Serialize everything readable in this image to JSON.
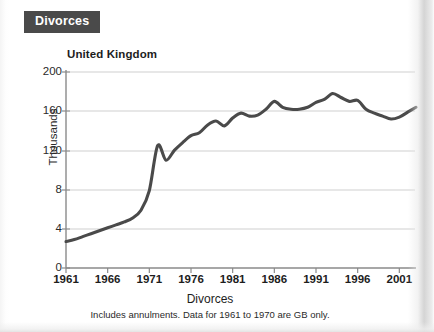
{
  "header": {
    "badge_label": "Divorces",
    "badge_bg": "#4a4a4a",
    "badge_fg": "#ffffff"
  },
  "chart_data": {
    "type": "line",
    "title": "United Kingdom",
    "section_title": "Divorces",
    "xlabel": "Divorces",
    "ylabel": "Thousands",
    "footnote": "Includes annulments. Data for 1961 to 1970 are GB only.",
    "line_color": "#4a4a4a",
    "grid": true,
    "legend": "none",
    "xlim": [
      1961,
      2003
    ],
    "ylim": [
      0,
      200
    ],
    "ytick_labels": [
      "200",
      "160",
      "120",
      "8",
      "4",
      "0"
    ],
    "ytick_values": [
      200,
      160,
      120,
      80,
      40,
      0
    ],
    "xtick_labels": [
      "1961",
      "1966",
      "1971",
      "1976",
      "1981",
      "1986",
      "1991",
      "1996",
      "2001"
    ],
    "xtick_values": [
      1961,
      1966,
      1971,
      1976,
      1981,
      1986,
      1991,
      1996,
      2001
    ],
    "x": [
      1961,
      1962,
      1963,
      1964,
      1965,
      1966,
      1967,
      1968,
      1969,
      1970,
      1971,
      1972,
      1973,
      1974,
      1975,
      1976,
      1977,
      1978,
      1979,
      1980,
      1981,
      1982,
      1983,
      1984,
      1985,
      1986,
      1987,
      1988,
      1989,
      1990,
      1991,
      1992,
      1993,
      1994,
      1995,
      1996,
      1997,
      1998,
      1999,
      2000,
      2001,
      2002,
      2003
    ],
    "values": [
      27,
      29,
      32,
      35,
      38,
      41,
      44,
      47,
      51,
      59,
      79,
      125,
      110,
      120,
      128,
      135,
      138,
      146,
      150,
      145,
      153,
      158,
      155,
      156,
      162,
      170,
      164,
      162,
      162,
      164,
      169,
      172,
      178,
      174,
      170,
      171,
      162,
      158,
      155,
      152,
      154,
      159,
      164
    ],
    "series": [
      {
        "name": "United Kingdom divorces",
        "values": [
          27,
          29,
          32,
          35,
          38,
          41,
          44,
          47,
          51,
          59,
          79,
          125,
          110,
          120,
          128,
          135,
          138,
          146,
          150,
          145,
          153,
          158,
          155,
          156,
          162,
          170,
          164,
          162,
          162,
          164,
          169,
          172,
          178,
          174,
          170,
          171,
          162,
          158,
          155,
          152,
          154,
          159,
          164
        ]
      }
    ],
    "units": "thousands"
  }
}
